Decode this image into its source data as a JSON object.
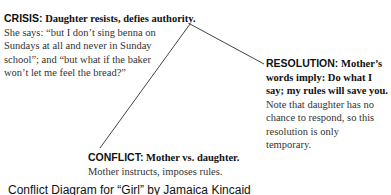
{
  "diagram": {
    "crisis": {
      "label": "CRISIS:",
      "heading": "Daughter resists, defies authority.",
      "body": "She says: “but I don’t sing benna on Sundays at all and never in Sunday school”; and “but what if the baker won’t let me feel the bread?”"
    },
    "resolution": {
      "label": "RESOLUTION:",
      "heading": "Mother’s words imply: Do what I say; my rules will save you.",
      "body": "Note that daughter has no chance to respond, so this resolution is only temporary."
    },
    "conflict": {
      "label": "CONFLICT:",
      "heading": "Mother vs. daughter.",
      "body": "Mother instructs, imposes rules."
    },
    "caption": "Conflict Diagram for “Girl” by Jamaica Kincaid",
    "line_color": "#444444"
  }
}
